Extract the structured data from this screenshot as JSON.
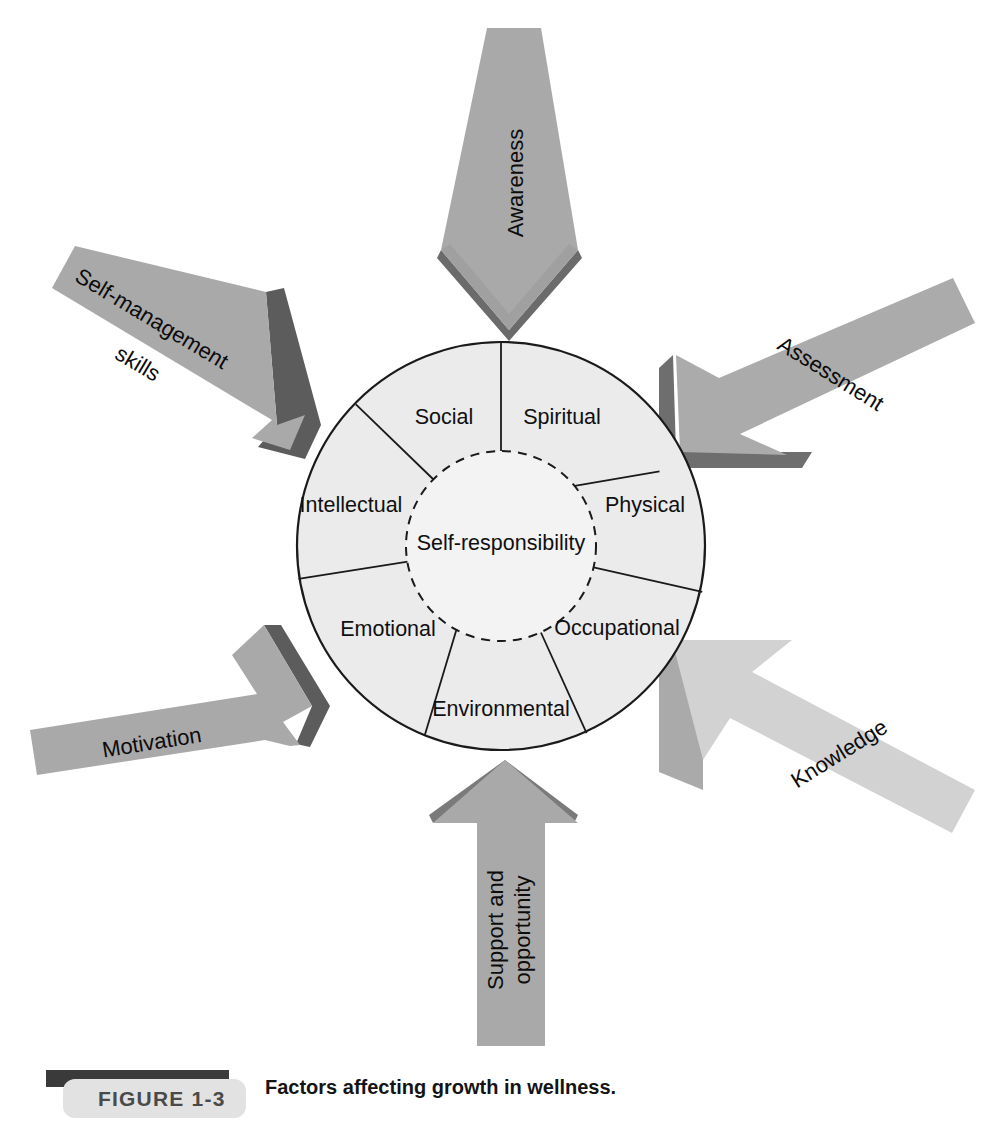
{
  "figure": {
    "badge_label": "FIGURE  1-3",
    "caption": "Factors affecting growth in wellness.",
    "badge_bar_color": "#3a3a3a",
    "badge_fill_color": "#e2e2e2",
    "badge_text_color": "#4a4a4a"
  },
  "wheel": {
    "center_label": "Self-responsibility",
    "outer_fill": "#ebebeb",
    "inner_fill": "#f2f2f2",
    "stroke_color": "#1a1a1a",
    "segments": [
      {
        "label": "Spiritual",
        "angle_deg": 64
      },
      {
        "label": "Physical",
        "angle_deg": 13
      },
      {
        "label": "Occupational",
        "angle_deg": -38
      },
      {
        "label": "Environmental",
        "angle_deg": -90
      },
      {
        "label": "Emotional",
        "angle_deg": -141
      },
      {
        "label": "Intellectual",
        "angle_deg": 167
      },
      {
        "label": "Social",
        "angle_deg": 116
      }
    ]
  },
  "arrows": [
    {
      "id": "awareness",
      "label": "Awareness",
      "direction": "down",
      "face_color": "#a9a9a9",
      "shadow_color": "#6b6b6b"
    },
    {
      "id": "assessment",
      "label": "Assessment",
      "direction": "down-left",
      "face_color": "#ababab",
      "shadow_color": "#6e6e6e"
    },
    {
      "id": "knowledge",
      "label": "Knowledge",
      "direction": "up-left",
      "face_color": "#d2d2d2",
      "shadow_color": "#aaaaaa"
    },
    {
      "id": "support-and-opportunity",
      "label_line1": "Support and",
      "label_line2": "opportunity",
      "direction": "up",
      "face_color": "#a9a9a9",
      "shadow_color": "#7a7a7a"
    },
    {
      "id": "motivation",
      "label": "Motivation",
      "direction": "up-right",
      "face_color": "#a9a9a9",
      "shadow_color": "#5c5c5c"
    },
    {
      "id": "self-management-skills",
      "label_line1": "Self-management",
      "label_line2": "skills",
      "direction": "down-right",
      "face_color": "#a9a9a9",
      "shadow_color": "#5c5c5c"
    }
  ]
}
